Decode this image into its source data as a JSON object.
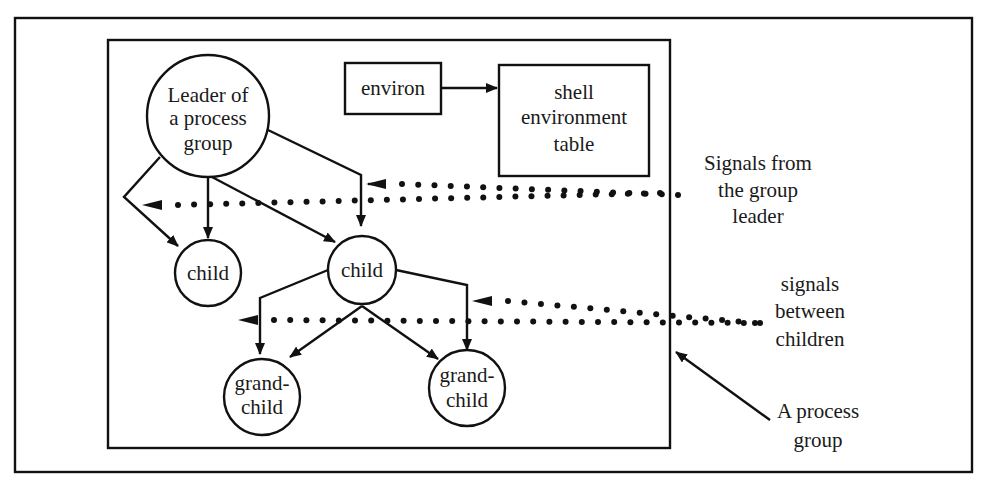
{
  "diagram": {
    "type": "process-group-signals",
    "colors": {
      "stroke": "#111111",
      "background": "#ffffff",
      "text": "#1a1a1a"
    },
    "nodes": {
      "leader": {
        "lines": [
          "Leader of",
          "a process",
          "group"
        ],
        "shape": "circle"
      },
      "child_left": {
        "lines": [
          "child"
        ],
        "shape": "circle"
      },
      "child_right": {
        "lines": [
          "child"
        ],
        "shape": "circle"
      },
      "grandchild_left": {
        "lines": [
          "grand-",
          "child"
        ],
        "shape": "circle"
      },
      "grandchild_right": {
        "lines": [
          "grand-",
          "child"
        ],
        "shape": "circle"
      },
      "environ": {
        "lines": [
          "environ"
        ],
        "shape": "box"
      },
      "env_table": {
        "lines": [
          "shell",
          "environment",
          "table"
        ],
        "shape": "box"
      }
    },
    "labels": {
      "signals_leader": [
        "Signals from",
        "the group",
        "leader"
      ],
      "signals_children": [
        "signals",
        "between",
        "children"
      ],
      "process_group": [
        "A process",
        "group"
      ]
    },
    "edges": [
      {
        "from": "leader",
        "to": "child_left",
        "style": "solid"
      },
      {
        "from": "leader",
        "to": "child_right",
        "style": "solid"
      },
      {
        "from": "child_right",
        "to": "grandchild_left",
        "style": "solid"
      },
      {
        "from": "child_right",
        "to": "grandchild_right",
        "style": "solid"
      },
      {
        "from": "environ",
        "to": "env_table",
        "style": "solid"
      },
      {
        "from": "signals_leader",
        "to": "group",
        "style": "dotted"
      },
      {
        "from": "signals_children",
        "to": "children",
        "style": "dotted"
      }
    ]
  }
}
